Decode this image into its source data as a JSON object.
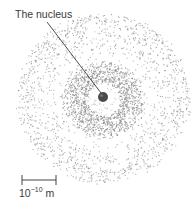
{
  "diagram": {
    "nucleus_label": "The nucleus",
    "scale": {
      "base": "10",
      "exponent": "−10",
      "unit": "m"
    },
    "colors": {
      "background": "#ffffff",
      "dots": "#8a8a8a",
      "nucleus": "#4a4a4a",
      "line": "#3a3a3a"
    },
    "geometry": {
      "nucleus_center": [
        103,
        96
      ],
      "nucleus_radius": 5,
      "inner_ring_radius": [
        18,
        40
      ],
      "outer_cloud_radius": 86
    }
  }
}
